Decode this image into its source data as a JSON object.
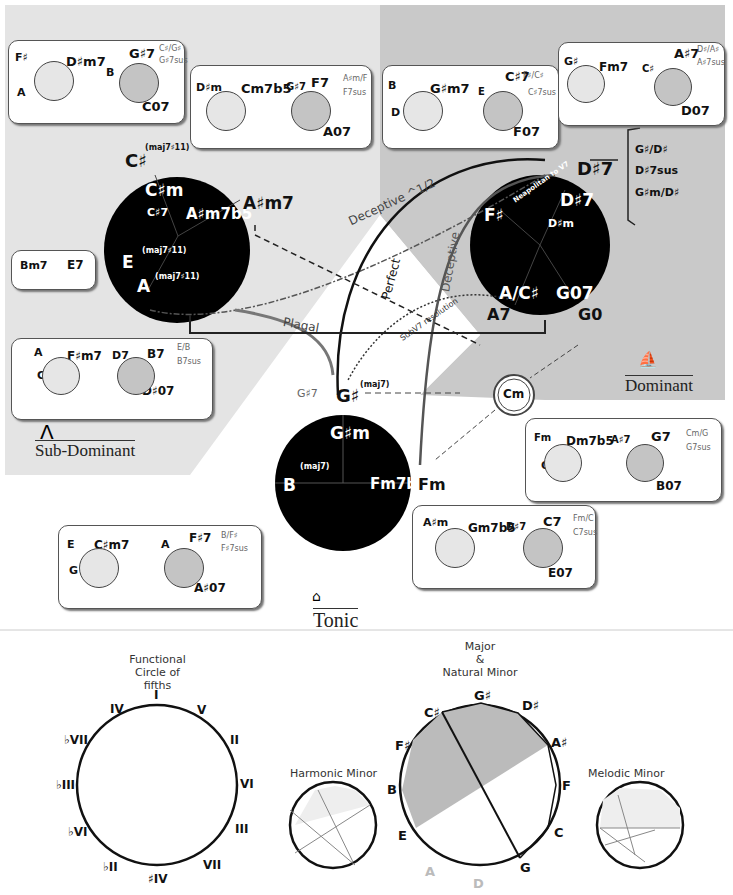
{
  "regions": {
    "sub_dominant": {
      "label": "Sub-Dominant",
      "icon": "arch-icon"
    },
    "dominant": {
      "label": "Dominant",
      "icon": "sailboat-icon"
    },
    "tonic": {
      "label": "Tonic",
      "icon": "house-icon"
    }
  },
  "colors": {
    "subdominant_bg": "#e4e4e4",
    "dominant_bg": "#c9c9c9",
    "circle_fill": "#000000",
    "mini_light": "#e6e6e6",
    "mini_dark": "#c4c4c4"
  },
  "big_circles": {
    "subdominant": {
      "top": "C♯",
      "top_sup": "(maj7♯11)",
      "inner": [
        "C♯m",
        "C♯7",
        "A♯m7b5"
      ],
      "right_outside": "A♯m7",
      "left_e": "E",
      "e_sup": "(maj7♯11)",
      "left_a": "A",
      "a_sup": "(maj7♯11)"
    },
    "dominant": {
      "top": "D♯7",
      "inner": [
        "D♯7",
        "D♯m",
        "F♯",
        "A/C♯",
        "G07"
      ],
      "bottom_left": "A7",
      "bottom_right": "G0",
      "neapolitan": "Neapolitan to V7",
      "bracket": [
        "G♯/D♯",
        "D♯7sus",
        "G♯m/D♯"
      ]
    },
    "tonic": {
      "top": "G♯",
      "top_sup": "(maj7)",
      "top_alt": "G♯7",
      "inner": [
        "G♯m",
        "(maj7)",
        "B",
        "Fm7b5"
      ],
      "right_outside": "Fm"
    },
    "cm": "Cm"
  },
  "arrows": {
    "deceptive_half": "Deceptive ^1/2",
    "perfect": "Perfect",
    "deceptive": "Deceptive",
    "plagal": "Plagal",
    "subv7": "SubV7 resolution"
  },
  "boxes": [
    {
      "id": "box1",
      "left": [
        "F♯",
        "A",
        "D♯m7"
      ],
      "right": [
        "B",
        "G♯7",
        "C07"
      ],
      "alt": [
        "C♯/G♯",
        "G♯7sus"
      ]
    },
    {
      "id": "box2",
      "left": [
        "D♯m",
        "F♯",
        "Cm7b5"
      ],
      "right": [
        "G♯7",
        "F7",
        "A07"
      ],
      "alt": [
        "A♯m/F",
        "F7sus"
      ]
    },
    {
      "id": "box3",
      "left": [
        "B",
        "D",
        "G♯m7"
      ],
      "right": [
        "E",
        "C♯7",
        "F07"
      ],
      "alt": [
        "F♯/C♯",
        "C♯7sus"
      ]
    },
    {
      "id": "box4",
      "left": [
        "G♯",
        "B",
        "Fm7"
      ],
      "right": [
        "C♯",
        "A♯7",
        "D07"
      ],
      "alt": [
        "D♯/A♯",
        "A♯7sus"
      ]
    },
    {
      "id": "box5",
      "left": [
        "Bm7"
      ],
      "right": [
        "E7"
      ],
      "alt": []
    },
    {
      "id": "box6",
      "left": [
        "A",
        "C",
        "F♯m7"
      ],
      "right": [
        "D7",
        "B7",
        "D♯07"
      ],
      "alt": [
        "E/B",
        "B7sus"
      ]
    },
    {
      "id": "box7",
      "left": [
        "Fm",
        "G♯",
        "Dm7b5"
      ],
      "right": [
        "A♯7",
        "G7",
        "B07"
      ],
      "alt": [
        "Cm/G",
        "G7sus"
      ]
    },
    {
      "id": "box8",
      "left": [
        "E",
        "G",
        "C♯m7"
      ],
      "right": [
        "A",
        "F♯7",
        "A♯07"
      ],
      "alt": [
        "B/F♯",
        "F♯7sus"
      ]
    },
    {
      "id": "box9",
      "left": [
        "A♯m",
        "C♯",
        "Gm7b5"
      ],
      "right": [
        "D♯7",
        "C7",
        "E07"
      ],
      "alt": [
        "Fm/C",
        "C7sus"
      ]
    }
  ],
  "bottom": {
    "functional": {
      "title1": "Functional",
      "title2": "Circle of fifths",
      "labels": [
        "I",
        "V",
        "II",
        "VI",
        "III",
        "VII",
        "♯IV",
        "♭II",
        "♭VI",
        "♭III",
        "♭VII",
        "IV"
      ]
    },
    "harmonic": {
      "title": "Harmonic Minor"
    },
    "major": {
      "title1": "Major",
      "title2": "&",
      "title3": "Natural Minor",
      "labels": [
        "G♯",
        "D♯",
        "A♯",
        "F",
        "C",
        "G",
        "D",
        "A",
        "E",
        "B",
        "F♯",
        "C♯"
      ]
    },
    "melodic": {
      "title": "Melodic Minor"
    }
  }
}
